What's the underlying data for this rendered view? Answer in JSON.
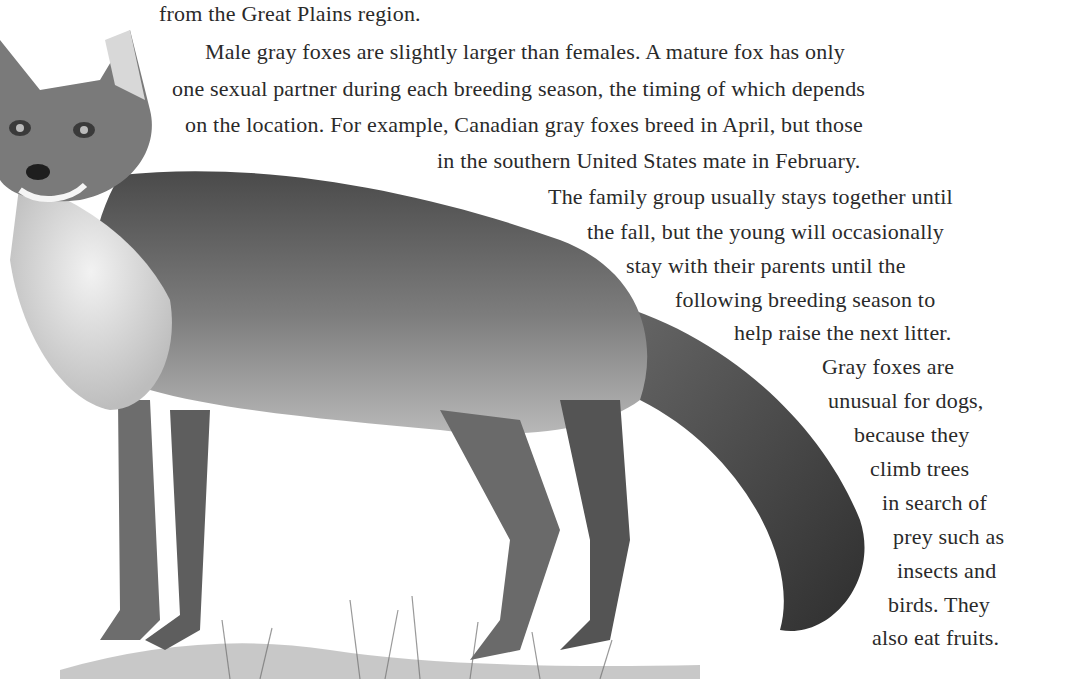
{
  "page": {
    "illustration": {
      "subject": "gray fox",
      "style": "grayscale pencil illustration",
      "icon": "fox-illustration"
    },
    "text_lines": [
      {
        "text": "from the Great Plains region.",
        "x": 159,
        "y": 0
      },
      {
        "text": "Male gray foxes are slightly larger than females. A mature fox has only",
        "x": 205,
        "y": 38
      },
      {
        "text": "one sexual partner during each breeding season, the timing of which depends",
        "x": 172,
        "y": 75
      },
      {
        "text": "on the location. For example, Canadian gray foxes breed in April, but those",
        "x": 185,
        "y": 111
      },
      {
        "text": "in the southern United States mate in February.",
        "x": 437,
        "y": 147
      },
      {
        "text": "The family group usually stays together until",
        "x": 548,
        "y": 183
      },
      {
        "text": "the fall, but the young will occasionally",
        "x": 587,
        "y": 218
      },
      {
        "text": "stay with their parents until the",
        "x": 626,
        "y": 252
      },
      {
        "text": "following breeding season to",
        "x": 675,
        "y": 286
      },
      {
        "text": "help raise the next litter.",
        "x": 734,
        "y": 319
      },
      {
        "text": "Gray foxes are",
        "x": 822,
        "y": 353
      },
      {
        "text": "unusual for dogs,",
        "x": 828,
        "y": 387
      },
      {
        "text": "because they",
        "x": 854,
        "y": 421
      },
      {
        "text": "climb trees",
        "x": 870,
        "y": 455
      },
      {
        "text": "in search of",
        "x": 882,
        "y": 489
      },
      {
        "text": "prey such as",
        "x": 893,
        "y": 523
      },
      {
        "text": "insects and",
        "x": 897,
        "y": 557
      },
      {
        "text": "birds. They",
        "x": 888,
        "y": 591
      },
      {
        "text": "also eat fruits.",
        "x": 872,
        "y": 624
      }
    ]
  }
}
